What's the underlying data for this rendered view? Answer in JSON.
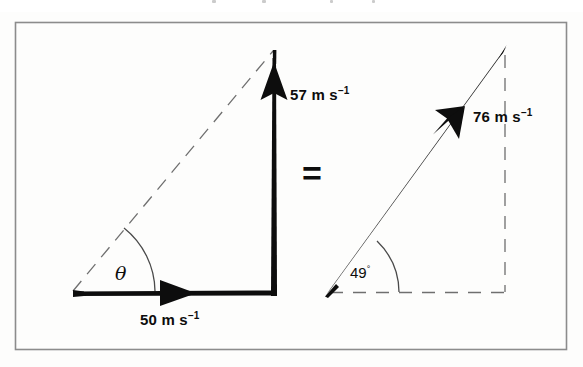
{
  "figure": {
    "type": "vector-addition-diagram",
    "frame": {
      "x": 15,
      "y": 22,
      "width": 552,
      "height": 328,
      "color": "#8c8c8c"
    },
    "background_color": "#fdfdfc",
    "ink_color": "#0d0d0d",
    "equals_sign": "=",
    "left_diagram": {
      "name": "component-vectors",
      "origin": {
        "x": 73,
        "y": 292
      },
      "corner": {
        "x": 274,
        "y": 291
      },
      "apex": {
        "x": 274,
        "y": 50
      },
      "horizontal_vector": {
        "label": "50 m s",
        "exponent": "−1",
        "value": 50,
        "unit": "m s^-1",
        "direction": "right",
        "style": "solid-bold"
      },
      "vertical_vector": {
        "label": "57 m s",
        "exponent": "−1",
        "value": 57,
        "unit": "m s^-1",
        "direction": "up",
        "style": "solid-bold"
      },
      "hypotenuse": {
        "style": "dashed-thin"
      },
      "angle": {
        "label": "θ",
        "style": "arc-thin"
      }
    },
    "right_diagram": {
      "name": "resultant-vector",
      "origin": {
        "x": 327,
        "y": 293
      },
      "apex": {
        "x": 505,
        "y": 48
      },
      "foot": {
        "x": 505,
        "y": 293
      },
      "resultant_vector": {
        "label": "76 m s",
        "exponent": "−1",
        "value": 76,
        "unit": "m s^-1",
        "direction": "up-right",
        "style": "solid-bold"
      },
      "vertical_side": {
        "style": "dashed-thin"
      },
      "horizontal_side": {
        "style": "dashed-thin"
      },
      "angle": {
        "label": "49",
        "degree_symbol": "°",
        "value": 49,
        "style": "arc-thin"
      }
    },
    "labels": {
      "horizontal_component": "50 m s",
      "vertical_component": "57 m s",
      "resultant": "76 m s",
      "exponent": "−1",
      "theta": "θ",
      "angle_value": "49",
      "degree": "°"
    }
  }
}
